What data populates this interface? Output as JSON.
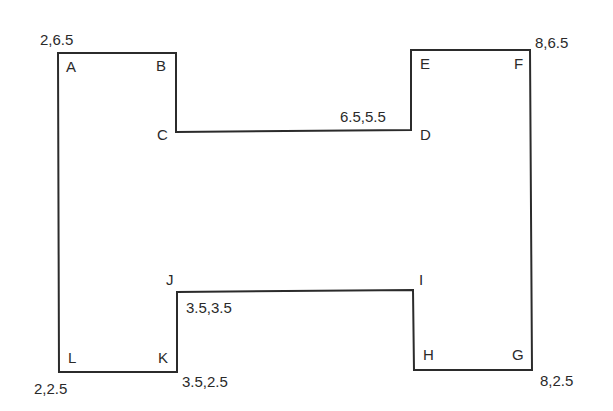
{
  "diagram": {
    "shape": "H-shaped polygon",
    "stroke_color": "#2b2b2b",
    "background": "#ffffff",
    "vertices": [
      {
        "id": "A",
        "label": "A",
        "x": 58,
        "y": 53
      },
      {
        "id": "B",
        "label": "B",
        "x": 176,
        "y": 53
      },
      {
        "id": "C",
        "label": "C",
        "x": 176,
        "y": 132
      },
      {
        "id": "D",
        "label": "D",
        "x": 411,
        "y": 130
      },
      {
        "id": "E",
        "label": "E",
        "x": 411,
        "y": 50
      },
      {
        "id": "F",
        "label": "F",
        "x": 530,
        "y": 50
      },
      {
        "id": "G",
        "label": "G",
        "x": 532,
        "y": 370
      },
      {
        "id": "H",
        "label": "H",
        "x": 414,
        "y": 370
      },
      {
        "id": "I",
        "label": "I",
        "x": 413,
        "y": 290
      },
      {
        "id": "J",
        "label": "J",
        "x": 177,
        "y": 292
      },
      {
        "id": "K",
        "label": "K",
        "x": 177,
        "y": 372
      },
      {
        "id": "L",
        "label": "L",
        "x": 59,
        "y": 372
      }
    ],
    "coordinate_labels": {
      "A": "2,6.5",
      "D": "6.5,5.5",
      "F": "8,6.5",
      "J": "3.5,3.5",
      "K": "3.5,2.5",
      "L": "2,2.5",
      "G": "8,2.5"
    }
  }
}
